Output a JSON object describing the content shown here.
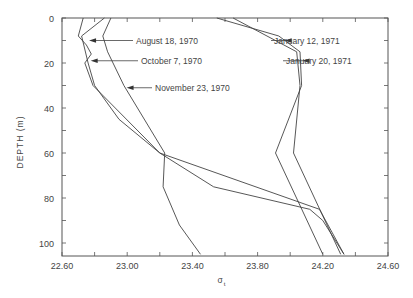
{
  "chart_data": {
    "type": "line",
    "title": "",
    "xlabel": "σt",
    "ylabel": "DEPTH (m)",
    "xlim": [
      22.6,
      24.6
    ],
    "ylim": [
      105,
      0
    ],
    "y_inverted": true,
    "grid": false,
    "x_ticks": [
      "22.60",
      "23.00",
      "23.40",
      "23.80",
      "24.20",
      "24.60"
    ],
    "y_ticks": [
      "0",
      "20",
      "40",
      "60",
      "80",
      "100"
    ],
    "legend_position": "inline-annotations",
    "series": [
      {
        "name": "August 18, 1970",
        "depth": [
          0,
          8,
          12,
          16,
          20,
          30,
          60,
          75,
          85,
          90,
          105
        ],
        "sigma_t": [
          22.73,
          22.7,
          22.75,
          22.78,
          22.74,
          22.79,
          23.2,
          23.53,
          24.12,
          24.2,
          24.33
        ],
        "label_depth": 10
      },
      {
        "name": "October 7, 1970",
        "depth": [
          0,
          8,
          20,
          30,
          45,
          60,
          85,
          105
        ],
        "sigma_t": [
          22.86,
          22.72,
          22.76,
          22.8,
          22.95,
          23.2,
          24.18,
          24.33
        ],
        "label_depth": 19
      },
      {
        "name": "November 23, 1970",
        "depth": [
          0,
          8,
          15,
          30,
          60,
          75,
          92,
          105
        ],
        "sigma_t": [
          22.9,
          22.85,
          22.88,
          22.98,
          23.23,
          23.22,
          23.32,
          23.45
        ],
        "label_depth": 31
      },
      {
        "name": "January 12, 1971",
        "depth": [
          0,
          8,
          15,
          30,
          60,
          105
        ],
        "sigma_t": [
          23.55,
          23.93,
          24.06,
          24.07,
          23.91,
          24.2
        ],
        "label_depth": 10
      },
      {
        "name": "January 20, 1971",
        "depth": [
          0,
          15,
          30,
          60,
          105
        ],
        "sigma_t": [
          23.65,
          24.04,
          24.06,
          24.02,
          24.31
        ],
        "label_depth": 19
      }
    ]
  },
  "annotations": [
    {
      "text": "August 18, 1970",
      "arrow_to_sigma": 22.76,
      "text_x": 136,
      "text_y": 45,
      "arrow_from_x": 133
    },
    {
      "text": "October 7, 1970",
      "arrow_to_sigma": 22.77,
      "text_x": 141,
      "text_y": 65,
      "arrow_from_x": 138
    },
    {
      "text": "November 23, 1970",
      "arrow_to_sigma": 22.99,
      "text_x": 155,
      "text_y": 91,
      "arrow_from_x": 152
    },
    {
      "text": "January 12, 1971",
      "arrow_to_sigma": 23.96,
      "text_x": 274,
      "text_y": 45,
      "arrow_from_x": 271
    },
    {
      "text": "January 20, 1971",
      "arrow_to_sigma": 24.07,
      "text_x": 286,
      "text_y": 65,
      "arrow_from_x": 283
    }
  ],
  "axes": {
    "x_title": "σ",
    "x_title_sub": "t",
    "y_title": "DEPTH (m)"
  }
}
